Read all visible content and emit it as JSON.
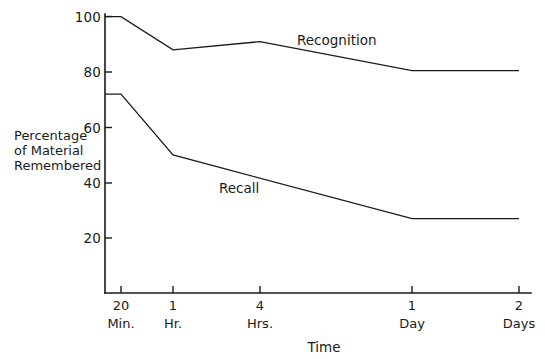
{
  "chart_data": {
    "type": "line",
    "title": "",
    "xlabel": "Time",
    "ylabel": "Percentage of Material Remembered",
    "ylabel_lines": [
      "Percentage",
      "of Material",
      "Remembered"
    ],
    "grid": false,
    "legend_position": "inline-labels",
    "ylim": [
      0,
      100
    ],
    "yticks": [
      20,
      40,
      60,
      80,
      100
    ],
    "ytick_labels": [
      "20",
      "40",
      "60",
      "80",
      "100"
    ],
    "categories": [
      "20 Min.",
      "1 Hr.",
      "4 Hrs.",
      "1 Day",
      "2 Days"
    ],
    "xtick_numbers": [
      "20",
      "1",
      "4",
      "1",
      "2"
    ],
    "xtick_units": [
      "Min.",
      "Hr.",
      "Hrs.",
      "Day",
      "Days"
    ],
    "x_positions": [
      121,
      173,
      260,
      412,
      519
    ],
    "series": [
      {
        "name": "Recognition",
        "label": "Recognition",
        "values": [
          100,
          88,
          91,
          80.5,
          80.5
        ],
        "origin_value": 100,
        "label_x": 297,
        "label_y": 45
      },
      {
        "name": "Recall",
        "label": "Recall",
        "values": [
          72,
          50,
          38,
          27,
          27
        ],
        "origin_value": 72,
        "label_x": 219,
        "label_y": 193
      }
    ],
    "colors": {
      "line": "#1a1a1a",
      "axis": "#1a1a1a",
      "background": "#ffffff"
    }
  }
}
